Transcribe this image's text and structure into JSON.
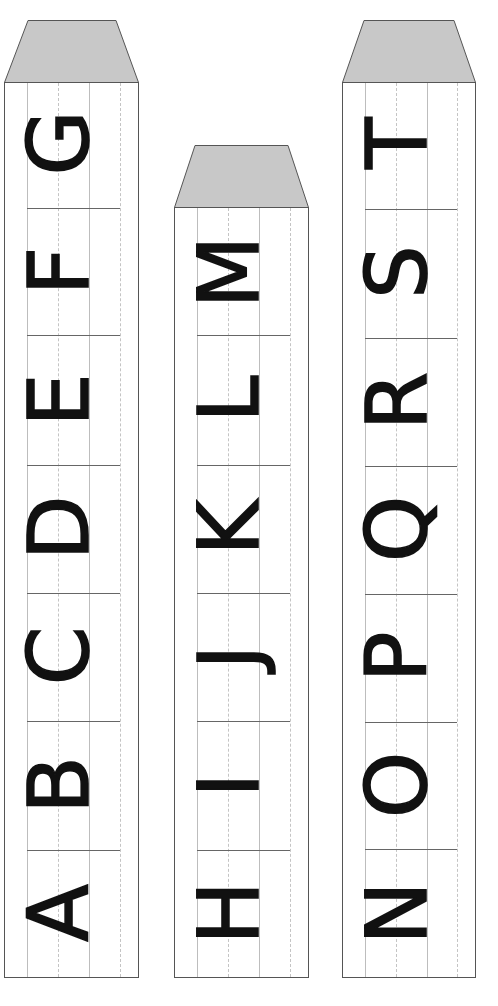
{
  "colors": {
    "roof": "#c8c8c8",
    "border": "#555555",
    "guide_solid": "#bdbdbd",
    "guide_dashed": "#c4c4c4",
    "divider": "#666666",
    "letter": "#111111"
  },
  "orientation": "letters rotated 90deg counter-clockwise, reading bottom to top",
  "towers": [
    {
      "id": "tower-1",
      "letters": [
        "A",
        "B",
        "C",
        "D",
        "E",
        "F",
        "G"
      ]
    },
    {
      "id": "tower-2",
      "letters": [
        "H",
        "I",
        "J",
        "K",
        "L",
        "M"
      ]
    },
    {
      "id": "tower-3",
      "letters": [
        "N",
        "O",
        "P",
        "Q",
        "R",
        "S",
        "T"
      ]
    }
  ]
}
